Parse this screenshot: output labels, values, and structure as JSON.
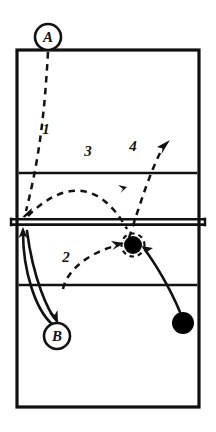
{
  "diagram": {
    "type": "court-play-diagram",
    "colors": {
      "line": "#111111",
      "fill": "#ffffff",
      "marker": "#000000"
    },
    "court": {
      "outline": {
        "x": 17,
        "y": 50,
        "width": 182,
        "height": 357
      },
      "net": {
        "y": 222,
        "x1": 11,
        "x2": 205
      },
      "attack_line_far": {
        "y": 173
      },
      "attack_line_near": {
        "y": 285
      }
    },
    "players": [
      {
        "id": "A",
        "label": "A",
        "shape": "circle-outline",
        "cx": 48,
        "cy": 37,
        "r": 13
      },
      {
        "id": "B",
        "label": "B",
        "shape": "circle-outline",
        "cx": 57,
        "cy": 336,
        "r": 13
      }
    ],
    "markers": [
      {
        "id": "ball-at-net",
        "label": "",
        "shape": "filled-circle-dashed-ring",
        "cx": 133,
        "cy": 245,
        "r": 9
      },
      {
        "id": "player-back-right",
        "label": "",
        "shape": "filled-circle",
        "cx": 183,
        "cy": 323,
        "r": 11
      }
    ],
    "path_labels": [
      {
        "id": "path-1",
        "text": "1",
        "x": 46,
        "y": 134
      },
      {
        "id": "path-2",
        "text": "2",
        "x": 66,
        "y": 262
      },
      {
        "id": "path-3",
        "text": "3",
        "x": 88,
        "y": 156
      },
      {
        "id": "path-4",
        "text": "4",
        "x": 133,
        "y": 151
      }
    ],
    "paths": {
      "dashed": [
        {
          "id": "serve-path-1",
          "d": "M48,50 C44,100 40,150 25,212",
          "arrow": "down-left-corner"
        },
        {
          "id": "pass-path-2",
          "d": "M63,288 C68,268 95,250 121,244",
          "arrow": "to-ball"
        },
        {
          "id": "set-path-3",
          "d": "M27,218 C55,190 90,172 126,232",
          "arrow": "mid"
        },
        {
          "id": "attack-path-4",
          "d": "M130,240 C142,200 152,170 167,144",
          "arrow": "up-right"
        }
      ],
      "solid": [
        {
          "id": "move-b-to-net",
          "d": "M24,228 C24,268 38,310 56,324",
          "arrow": "up-at-net"
        },
        {
          "id": "move-net-to-b",
          "d": "M26,230 C30,275 46,312 58,322",
          "arrow": "down-to-b"
        },
        {
          "id": "move-back-right-to-ball",
          "d": "M180,312 C168,286 152,262 142,249",
          "arrow": "to-ball"
        }
      ]
    }
  }
}
